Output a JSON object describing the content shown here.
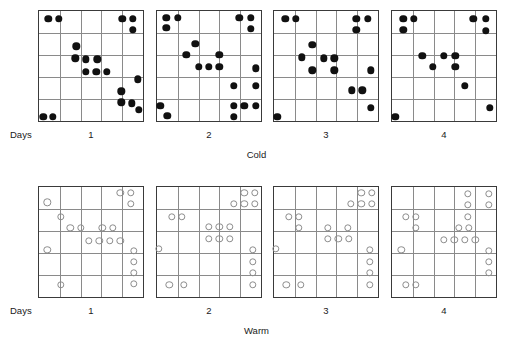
{
  "figure": {
    "title": "",
    "grid": {
      "rows": 5,
      "cols": 5
    },
    "days_axis_label": "Days",
    "day_ticks": [
      "1",
      "2",
      "3",
      "4"
    ],
    "colors": {
      "filled_marker": "#111111",
      "open_marker_stroke": "#8d8d8d",
      "panel_border": "#3a3a3a",
      "gridline": "#8a8a8a",
      "background": "#ffffff",
      "text": "#1a1a1a"
    },
    "marker_styles": {
      "cold": "filled-circle",
      "warm": "open-circle"
    }
  },
  "chart_data": {
    "type": "scatter",
    "title": "",
    "xlabel": "Days",
    "ylabel": "",
    "grid": true,
    "legend": "none",
    "xlim": [
      0,
      1
    ],
    "ylim": [
      0,
      1
    ],
    "panel_grid": {
      "rows": 5,
      "cols": 5
    },
    "panels": [
      {
        "group": "Cold",
        "marker": "filled-circle",
        "day": "1",
        "points": [
          [
            0.09,
            0.07
          ],
          [
            0.19,
            0.07
          ],
          [
            0.8,
            0.07
          ],
          [
            0.9,
            0.07
          ],
          [
            0.9,
            0.17
          ],
          [
            0.36,
            0.32
          ],
          [
            0.35,
            0.43
          ],
          [
            0.45,
            0.44
          ],
          [
            0.56,
            0.44
          ],
          [
            0.45,
            0.55
          ],
          [
            0.55,
            0.55
          ],
          [
            0.65,
            0.55
          ],
          [
            0.95,
            0.62
          ],
          [
            0.79,
            0.73
          ],
          [
            0.79,
            0.83
          ],
          [
            0.89,
            0.84
          ],
          [
            0.96,
            0.9
          ],
          [
            0.04,
            0.96
          ],
          [
            0.13,
            0.96
          ]
        ]
      },
      {
        "group": "Cold",
        "marker": "filled-circle",
        "day": "2",
        "points": [
          [
            0.09,
            0.06
          ],
          [
            0.09,
            0.15
          ],
          [
            0.2,
            0.06
          ],
          [
            0.79,
            0.06
          ],
          [
            0.9,
            0.06
          ],
          [
            0.9,
            0.16
          ],
          [
            0.37,
            0.3
          ],
          [
            0.28,
            0.4
          ],
          [
            0.6,
            0.4
          ],
          [
            0.4,
            0.51
          ],
          [
            0.5,
            0.51
          ],
          [
            0.6,
            0.51
          ],
          [
            0.95,
            0.52
          ],
          [
            0.74,
            0.68
          ],
          [
            0.95,
            0.68
          ],
          [
            0.03,
            0.86
          ],
          [
            0.1,
            0.95
          ],
          [
            0.74,
            0.86
          ],
          [
            0.84,
            0.86
          ],
          [
            0.95,
            0.86
          ],
          [
            0.74,
            0.96
          ]
        ]
      },
      {
        "group": "Cold",
        "marker": "filled-circle",
        "day": "3",
        "points": [
          [
            0.11,
            0.07
          ],
          [
            0.21,
            0.07
          ],
          [
            0.79,
            0.07
          ],
          [
            0.9,
            0.07
          ],
          [
            0.79,
            0.17
          ],
          [
            0.37,
            0.31
          ],
          [
            0.27,
            0.42
          ],
          [
            0.48,
            0.43
          ],
          [
            0.58,
            0.43
          ],
          [
            0.37,
            0.54
          ],
          [
            0.58,
            0.54
          ],
          [
            0.93,
            0.54
          ],
          [
            0.75,
            0.72
          ],
          [
            0.85,
            0.72
          ],
          [
            0.93,
            0.88
          ],
          [
            0.03,
            0.96
          ]
        ]
      },
      {
        "group": "Cold",
        "marker": "filled-circle",
        "day": "4",
        "points": [
          [
            0.11,
            0.07
          ],
          [
            0.11,
            0.17
          ],
          [
            0.21,
            0.07
          ],
          [
            0.78,
            0.07
          ],
          [
            0.9,
            0.07
          ],
          [
            0.9,
            0.18
          ],
          [
            0.29,
            0.41
          ],
          [
            0.5,
            0.41
          ],
          [
            0.61,
            0.41
          ],
          [
            0.39,
            0.51
          ],
          [
            0.61,
            0.51
          ],
          [
            0.7,
            0.68
          ],
          [
            0.94,
            0.88
          ],
          [
            0.03,
            0.96
          ]
        ]
      },
      {
        "group": "Warm",
        "marker": "open-circle",
        "day": "1",
        "points": [
          [
            0.78,
            0.05
          ],
          [
            0.88,
            0.05
          ],
          [
            0.88,
            0.15
          ],
          [
            0.08,
            0.14
          ],
          [
            0.21,
            0.27
          ],
          [
            0.3,
            0.37
          ],
          [
            0.4,
            0.37
          ],
          [
            0.61,
            0.37
          ],
          [
            0.71,
            0.37
          ],
          [
            0.48,
            0.49
          ],
          [
            0.58,
            0.49
          ],
          [
            0.68,
            0.49
          ],
          [
            0.78,
            0.49
          ],
          [
            0.08,
            0.57
          ],
          [
            0.91,
            0.58
          ],
          [
            0.91,
            0.68
          ],
          [
            0.91,
            0.78
          ],
          [
            0.91,
            0.88
          ],
          [
            0.21,
            0.89
          ]
        ]
      },
      {
        "group": "Warm",
        "marker": "open-circle",
        "day": "2",
        "points": [
          [
            0.84,
            0.05
          ],
          [
            0.94,
            0.05
          ],
          [
            0.74,
            0.15
          ],
          [
            0.84,
            0.15
          ],
          [
            0.94,
            0.15
          ],
          [
            0.14,
            0.27
          ],
          [
            0.24,
            0.27
          ],
          [
            0.5,
            0.36
          ],
          [
            0.6,
            0.36
          ],
          [
            0.7,
            0.36
          ],
          [
            0.5,
            0.47
          ],
          [
            0.6,
            0.47
          ],
          [
            0.7,
            0.47
          ],
          [
            0.02,
            0.56
          ],
          [
            0.92,
            0.57
          ],
          [
            0.92,
            0.68
          ],
          [
            0.92,
            0.78
          ],
          [
            0.92,
            0.89
          ],
          [
            0.12,
            0.89
          ],
          [
            0.26,
            0.89
          ]
        ]
      },
      {
        "group": "Warm",
        "marker": "open-circle",
        "day": "3",
        "points": [
          [
            0.84,
            0.05
          ],
          [
            0.94,
            0.05
          ],
          [
            0.74,
            0.15
          ],
          [
            0.84,
            0.15
          ],
          [
            0.94,
            0.15
          ],
          [
            0.14,
            0.27
          ],
          [
            0.24,
            0.27
          ],
          [
            0.24,
            0.37
          ],
          [
            0.52,
            0.37
          ],
          [
            0.71,
            0.37
          ],
          [
            0.52,
            0.47
          ],
          [
            0.62,
            0.47
          ],
          [
            0.72,
            0.47
          ],
          [
            0.02,
            0.56
          ],
          [
            0.92,
            0.57
          ],
          [
            0.92,
            0.68
          ],
          [
            0.92,
            0.78
          ],
          [
            0.92,
            0.89
          ],
          [
            0.12,
            0.89
          ],
          [
            0.26,
            0.89
          ]
        ]
      },
      {
        "group": "Warm",
        "marker": "open-circle",
        "day": "4",
        "points": [
          [
            0.73,
            0.06
          ],
          [
            0.93,
            0.06
          ],
          [
            0.73,
            0.16
          ],
          [
            0.93,
            0.16
          ],
          [
            0.13,
            0.27
          ],
          [
            0.23,
            0.27
          ],
          [
            0.23,
            0.37
          ],
          [
            0.73,
            0.27
          ],
          [
            0.64,
            0.37
          ],
          [
            0.74,
            0.37
          ],
          [
            0.5,
            0.48
          ],
          [
            0.6,
            0.48
          ],
          [
            0.7,
            0.48
          ],
          [
            0.8,
            0.48
          ],
          [
            0.09,
            0.57
          ],
          [
            0.93,
            0.58
          ],
          [
            0.93,
            0.68
          ],
          [
            0.93,
            0.78
          ],
          [
            0.13,
            0.89
          ],
          [
            0.23,
            0.89
          ]
        ]
      }
    ],
    "groups": [
      {
        "name": "Cold",
        "label": "Cold",
        "marker": "filled-circle"
      },
      {
        "name": "Warm",
        "label": "Warm",
        "marker": "open-circle"
      }
    ]
  },
  "cold_band": {
    "axis_label": "Days",
    "ticks": [
      "1",
      "2",
      "3",
      "4"
    ],
    "caption": "Cold"
  },
  "warm_band": {
    "axis_label": "Days",
    "ticks": [
      "1",
      "2",
      "3",
      "4"
    ],
    "caption": "Warm"
  }
}
